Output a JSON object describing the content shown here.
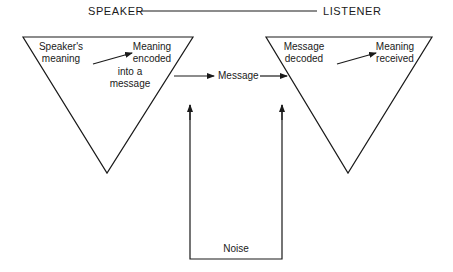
{
  "header": {
    "left": "SPEAKER",
    "right": "LISTENER"
  },
  "speaker_triangle": {
    "source": "Speaker's meaning",
    "source_line1": "Speaker's",
    "source_line2": "meaning",
    "target_line1": "Meaning",
    "target_line2": "encoded",
    "target_line3": "into a",
    "target_line4": "message"
  },
  "channel": {
    "label": "Message"
  },
  "listener_triangle": {
    "source_line1": "Message",
    "source_line2": "decoded",
    "target_line1": "Meaning",
    "target_line2": "received"
  },
  "noise": {
    "label": "Noise"
  },
  "colors": {
    "stroke": "#1a1a1a",
    "background": "#ffffff"
  }
}
